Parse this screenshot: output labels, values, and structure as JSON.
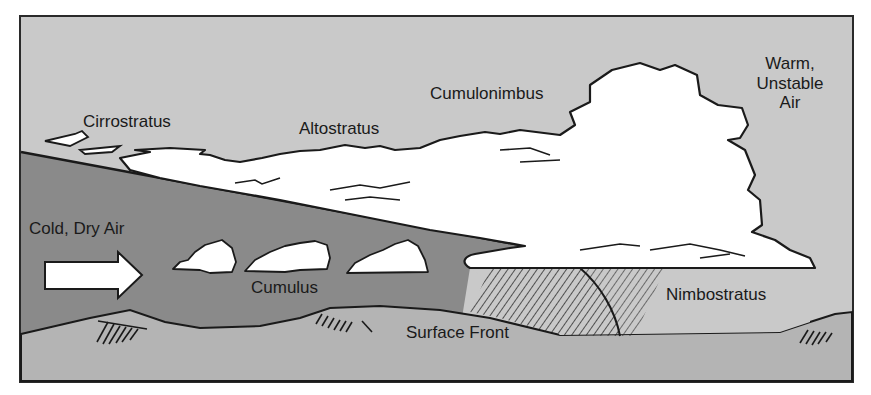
{
  "diagram": {
    "type": "weather-front-cross-section",
    "colors": {
      "upper_air": "#c9c9c9",
      "cold_air_mass": "#8a8a8a",
      "ground": "#b4b4b4",
      "cloud_fill": "#ffffff",
      "outline": "#1a1a1a",
      "frame": "#2a2a2a"
    },
    "labels": {
      "cirrostratus": "Cirrostratus",
      "altostratus": "Altostratus",
      "cumulonimbus": "Cumulonimbus",
      "warm_air_line1": "Warm,",
      "warm_air_line2": "Unstable",
      "warm_air_line3": "Air",
      "cold_air": "Cold, Dry Air",
      "cumulus": "Cumulus",
      "surface_front": "Surface Front",
      "nimbostratus": "Nimbostratus"
    },
    "elements": [
      {
        "name": "cold-air-arrow",
        "direction": "right"
      },
      {
        "name": "frontal-boundary",
        "description": "sloping line from upper-left down to surface front"
      },
      {
        "name": "precipitation-hatching",
        "description": "rain shafts beneath nimbostratus"
      },
      {
        "name": "terrain-hills",
        "count": 3
      }
    ]
  }
}
